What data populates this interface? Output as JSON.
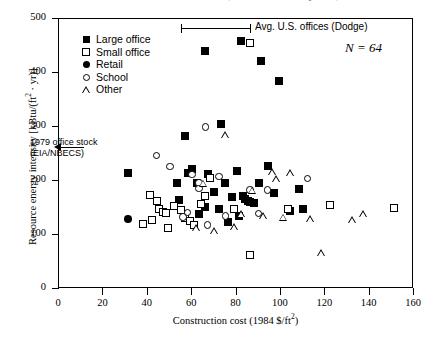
{
  "figure": {
    "cropped_header_text": "A Ratio 2, A       A A 3 2 4 8, J W   4 8 2 6 9, H W       9 4 8 H 3, J W   (from Koste and Tinley, 1988)"
  },
  "chart_data": {
    "type": "scatter",
    "title": "",
    "xlabel": "Construction cost (1984 $/ft2)",
    "ylabel": "Resource energy intensity [kBtu/(ft2 · yr)]",
    "xlim": [
      0,
      160
    ],
    "ylim": [
      0,
      500
    ],
    "xticks": [
      0,
      20,
      40,
      60,
      80,
      100,
      120,
      140,
      160
    ],
    "yticks": [
      0,
      100,
      200,
      300,
      400,
      500
    ],
    "grid": false,
    "legend_position": "upper-left-inside",
    "sample_size_label": "N = 64",
    "sample_size": 64,
    "legend": [
      {
        "label": "Large office",
        "marker": "filled-square"
      },
      {
        "label": "Small office",
        "marker": "open-square"
      },
      {
        "label": "Retail",
        "marker": "filled-circle"
      },
      {
        "label": "School",
        "marker": "open-circle"
      },
      {
        "label": "Other",
        "marker": "open-triangle"
      }
    ],
    "annotations": [
      {
        "name": "avg-us-offices-errorbar",
        "text": "Avg. U.S. offices (Dodge)",
        "x_range": [
          60,
          94
        ],
        "y": 489
      },
      {
        "name": "office-stock-arrow",
        "text_line1": "1979 office stock",
        "text_line2": "(EIA/NBECS)",
        "y": 262
      }
    ],
    "series": [
      {
        "name": "Large office",
        "marker": "filled-square",
        "points": [
          [
            31,
            215
          ],
          [
            57,
            283
          ],
          [
            66,
            440
          ],
          [
            73,
            305
          ],
          [
            82,
            460
          ],
          [
            91,
            422
          ],
          [
            99,
            386
          ],
          [
            53,
            196
          ],
          [
            58,
            215
          ],
          [
            60,
            222
          ],
          [
            62,
            196
          ],
          [
            67,
            213
          ],
          [
            70,
            179
          ],
          [
            75,
            196
          ],
          [
            78,
            171
          ],
          [
            80,
            218
          ],
          [
            83,
            172
          ],
          [
            84,
            166
          ],
          [
            85,
            163
          ],
          [
            86,
            161
          ],
          [
            88,
            160
          ],
          [
            90,
            196
          ],
          [
            97,
            178
          ],
          [
            104,
            145
          ],
          [
            108,
            186
          ],
          [
            63,
            139
          ],
          [
            81,
            136
          ],
          [
            72,
            148
          ],
          [
            66,
            152
          ],
          [
            54,
            165
          ],
          [
            94,
            228
          ],
          [
            76,
            125
          ],
          [
            110,
            148
          ]
        ]
      },
      {
        "name": "Small office",
        "marker": "open-square",
        "points": [
          [
            86,
            455
          ],
          [
            41,
            175
          ],
          [
            44,
            163
          ],
          [
            45,
            148
          ],
          [
            47,
            143
          ],
          [
            48,
            140
          ],
          [
            52,
            154
          ],
          [
            55,
            147
          ],
          [
            57,
            131
          ],
          [
            59,
            126
          ],
          [
            61,
            118
          ],
          [
            64,
            158
          ],
          [
            66,
            172
          ],
          [
            79,
            148
          ],
          [
            103,
            148
          ],
          [
            122,
            155
          ],
          [
            151,
            150
          ],
          [
            38,
            120
          ],
          [
            42,
            128
          ],
          [
            49,
            113
          ],
          [
            68,
            205
          ],
          [
            86,
            63
          ]
        ]
      },
      {
        "name": "Retail",
        "marker": "filled-circle",
        "points": [
          [
            31,
            130
          ],
          [
            88,
            160
          ],
          [
            85,
            163
          ]
        ]
      },
      {
        "name": "School",
        "marker": "open-circle",
        "points": [
          [
            44,
            247
          ],
          [
            50,
            227
          ],
          [
            66,
            300
          ],
          [
            60,
            212
          ],
          [
            63,
            196
          ],
          [
            63,
            186
          ],
          [
            72,
            208
          ],
          [
            86,
            183
          ],
          [
            75,
            135
          ],
          [
            67,
            118
          ],
          [
            56,
            133
          ],
          [
            58,
            142
          ],
          [
            94,
            183
          ],
          [
            90,
            140
          ],
          [
            112,
            205
          ]
        ]
      },
      {
        "name": "Other",
        "marker": "open-triangle",
        "points": [
          [
            75,
            285
          ],
          [
            65,
            196
          ],
          [
            87,
            183
          ],
          [
            96,
            218
          ],
          [
            98,
            205
          ],
          [
            104,
            215
          ],
          [
            92,
            135
          ],
          [
            101,
            133
          ],
          [
            113,
            130
          ],
          [
            118,
            68
          ],
          [
            132,
            128
          ],
          [
            70,
            108
          ],
          [
            79,
            115
          ],
          [
            82,
            140
          ],
          [
            62,
            113
          ],
          [
            137,
            140
          ]
        ]
      }
    ]
  }
}
